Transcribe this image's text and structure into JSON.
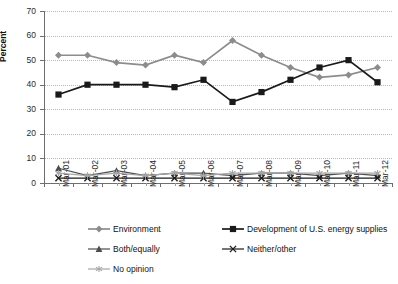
{
  "chart_data": {
    "type": "line",
    "title": "",
    "xlabel": "",
    "ylabel": "Percent",
    "ylim": [
      0,
      70
    ],
    "ytick_step": 10,
    "grid": true,
    "legend_position": "bottom",
    "categories": [
      "Mar-01",
      "Mar-02",
      "Mar-03",
      "Mar-04",
      "Mar-05",
      "Mar-06",
      "Mar-07",
      "Mar-08",
      "Mar-09",
      "Mar-10",
      "Mar-11",
      "Mar-12"
    ],
    "series": [
      {
        "name": "Environment",
        "color": "#8c8c8c",
        "marker": "diamond",
        "values": [
          52,
          52,
          49,
          48,
          52,
          49,
          58,
          52,
          47,
          43,
          44,
          47
        ]
      },
      {
        "name": "Development of U.S. energy supplies",
        "color": "#1a1a1a",
        "marker": "square",
        "values": [
          36,
          40,
          40,
          40,
          39,
          42,
          33,
          37,
          42,
          47,
          50,
          41
        ]
      },
      {
        "name": "Both/equally",
        "color": "#4d4d4d",
        "marker": "triangle",
        "values": [
          6,
          3,
          5,
          3,
          4,
          4,
          3,
          4,
          4,
          3,
          4,
          3
        ]
      },
      {
        "name": "Neither/other",
        "color": "#1a1a1a",
        "marker": "x",
        "values": [
          2,
          2,
          2,
          2,
          2,
          2,
          2,
          2,
          2,
          2,
          2,
          2
        ]
      },
      {
        "name": "No opinion",
        "color": "#a6a6a6",
        "marker": "asterisk",
        "values": [
          4,
          3,
          4,
          3,
          4,
          3,
          4,
          4,
          4,
          4,
          4,
          4
        ]
      }
    ],
    "ytick_labels": [
      "0",
      "10",
      "20",
      "30",
      "40",
      "50",
      "60",
      "70"
    ]
  },
  "legend": {
    "items": [
      {
        "label": "Environment",
        "key": "diamond-line-gray"
      },
      {
        "label": "Development of U.S. energy supplies",
        "key": "square-line-black"
      },
      {
        "label": "Both/equally",
        "key": "triangle-line-dark"
      },
      {
        "label": "Neither/other",
        "key": "x-line-black"
      },
      {
        "label": "No opinion",
        "key": "asterisk-line-lightgray"
      }
    ]
  },
  "colors": {
    "environment": "#8c8c8c",
    "development": "#1a1a1a",
    "both": "#4d4d4d",
    "neither": "#1a1a1a",
    "no_opinion": "#a6a6a6",
    "grid": "#b9b9b9",
    "axis": "#6f6f6f",
    "background": "#ffffff"
  }
}
